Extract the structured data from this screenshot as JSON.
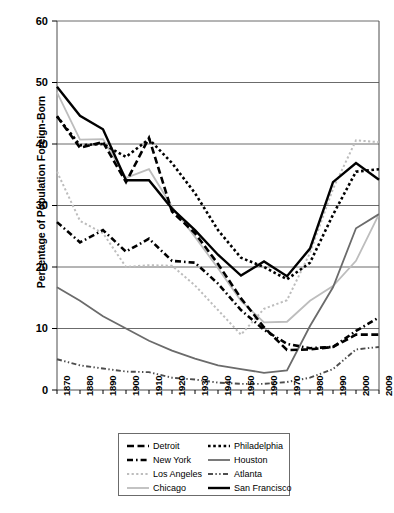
{
  "chart_data": {
    "type": "line",
    "title": "",
    "xlabel": "",
    "ylabel": "Percentage of Population Foreign-Born",
    "ylim": [
      0,
      60
    ],
    "ytick_labels": [
      "0",
      "10",
      "20",
      "30",
      "40",
      "50",
      "60"
    ],
    "yticks": [
      0,
      10,
      20,
      30,
      40,
      50,
      60
    ],
    "grid": "horizontal",
    "legend_position": "below-center",
    "categories": [
      "1870",
      "1880",
      "1890",
      "1900",
      "1910",
      "1920",
      "1930",
      "1940",
      "1950",
      "1960",
      "1970",
      "1980",
      "1990",
      "2000",
      "2009"
    ],
    "x": [
      1870,
      1880,
      1890,
      1900,
      1910,
      1920,
      1930,
      1940,
      1950,
      1960,
      1970,
      1980,
      1990,
      2000,
      2009
    ],
    "series": [
      {
        "name": "Detroit",
        "style": "dashed",
        "color": "#000000",
        "values": [
          44.5,
          39.4,
          40.3,
          33.8,
          41.0,
          29.0,
          25.5,
          20.5,
          14.9,
          10.2,
          6.5,
          6.6,
          7.0,
          9.0,
          9.0
        ]
      },
      {
        "name": "New York",
        "style": "dash-dot",
        "color": "#000000",
        "values": [
          27.3,
          24.0,
          26.0,
          22.5,
          24.6,
          21.0,
          20.7,
          17.3,
          13.0,
          9.8,
          7.5,
          6.8,
          7.0,
          9.6,
          11.8
        ]
      },
      {
        "name": "Los Angeles",
        "style": "dotted-light",
        "color": "#bdbdbd",
        "values": [
          35.5,
          27.5,
          25.5,
          20.0,
          20.3,
          20.2,
          17.0,
          13.0,
          9.0,
          13.2,
          14.6,
          22.3,
          32.7,
          40.6,
          40.3
        ]
      },
      {
        "name": "Chicago",
        "style": "solid-light",
        "color": "#bdbdbd",
        "values": [
          48.4,
          40.7,
          40.8,
          34.5,
          35.9,
          29.8,
          24.9,
          19.8,
          14.5,
          11.0,
          11.1,
          14.5,
          16.9,
          21.0,
          28.6
        ]
      },
      {
        "name": "Philadelphia",
        "style": "dotted-heavy",
        "color": "#000000",
        "values": [
          44.5,
          39.8,
          40.0,
          37.9,
          40.8,
          36.9,
          32.0,
          26.0,
          21.5,
          20.0,
          18.0,
          20.7,
          28.5,
          35.5,
          35.9
        ]
      },
      {
        "name": "Houston",
        "style": "solid-medium",
        "color": "#6b6b6b",
        "values": [
          16.7,
          14.5,
          12.0,
          10.0,
          8.0,
          6.4,
          5.1,
          4.0,
          3.4,
          2.8,
          3.2,
          10.4,
          16.7,
          26.3,
          28.6
        ]
      },
      {
        "name": "Atlanta",
        "style": "dash-dot-dot",
        "color": "#4d4d4d",
        "values": [
          5.0,
          4.0,
          3.5,
          3.0,
          2.9,
          2.0,
          1.7,
          1.2,
          1.0,
          1.0,
          1.3,
          2.0,
          3.4,
          6.6,
          7.0
        ]
      },
      {
        "name": "San Francisco",
        "style": "solid-heavy",
        "color": "#000000",
        "values": [
          49.3,
          44.6,
          42.4,
          34.1,
          34.1,
          29.5,
          26.0,
          22.0,
          18.6,
          20.9,
          18.5,
          23.0,
          33.8,
          36.9,
          34.2
        ]
      }
    ],
    "legend": [
      {
        "label": "Detroit",
        "style": "dashed",
        "color": "#000000"
      },
      {
        "label": "Philadelphia",
        "style": "dotted-heavy",
        "color": "#000000"
      },
      {
        "label": "New York",
        "style": "dash-dot",
        "color": "#000000"
      },
      {
        "label": "Houston",
        "style": "solid-medium",
        "color": "#6b6b6b"
      },
      {
        "label": "Los Angeles",
        "style": "dotted-light",
        "color": "#bdbdbd"
      },
      {
        "label": "Atlanta",
        "style": "dash-dot-dot",
        "color": "#4d4d4d"
      },
      {
        "label": "Chicago",
        "style": "solid-light",
        "color": "#bdbdbd"
      },
      {
        "label": "San Francisco",
        "style": "solid-heavy",
        "color": "#000000"
      }
    ]
  }
}
